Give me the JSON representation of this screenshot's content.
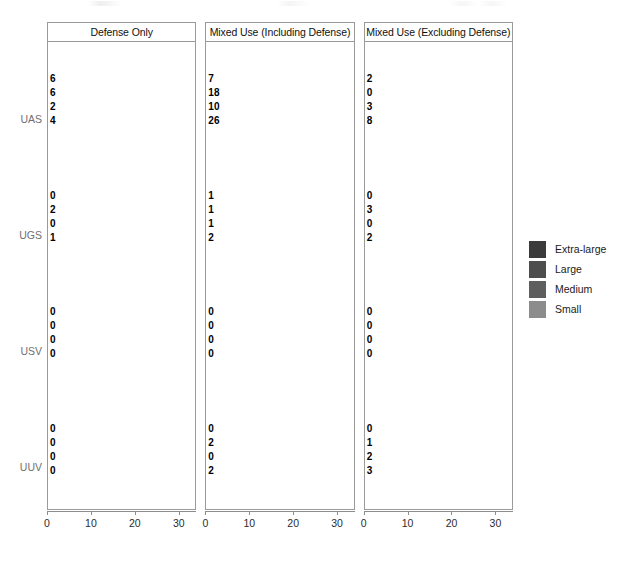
{
  "chart_data": {
    "type": "bar",
    "orientation": "horizontal",
    "title": "",
    "subtitle": "",
    "xlabel": "",
    "ylabel": "",
    "xlim": [
      0,
      34
    ],
    "xticks": [
      0,
      10,
      20,
      30
    ],
    "xticklabels": [
      "0",
      "10",
      "20",
      "30"
    ],
    "grid": false,
    "categories": [
      "UAS",
      "UGS",
      "USV",
      "UUV"
    ],
    "legend": {
      "position": "right",
      "entries": [
        {
          "name": "Extra-large",
          "color": "#3b3b3b"
        },
        {
          "name": "Large",
          "color": "#4d4d4d"
        },
        {
          "name": "Medium",
          "color": "#5e5e5e"
        },
        {
          "name": "Small",
          "color": "#8c8c8c"
        }
      ]
    },
    "panels": [
      {
        "label": "Defense Only",
        "series": [
          {
            "name": "Extra-large",
            "values": [
              6,
              0,
              0,
              0
            ]
          },
          {
            "name": "Large",
            "values": [
              6,
              2,
              0,
              0
            ]
          },
          {
            "name": "Medium",
            "values": [
              2,
              0,
              0,
              0
            ]
          },
          {
            "name": "Small",
            "values": [
              4,
              1,
              0,
              0
            ]
          }
        ]
      },
      {
        "label": "Mixed Use (Including Defense)",
        "series": [
          {
            "name": "Extra-large",
            "values": [
              7,
              1,
              0,
              0
            ]
          },
          {
            "name": "Large",
            "values": [
              18,
              1,
              0,
              2
            ]
          },
          {
            "name": "Medium",
            "values": [
              10,
              1,
              0,
              0
            ]
          },
          {
            "name": "Small",
            "values": [
              26,
              2,
              0,
              2
            ]
          }
        ]
      },
      {
        "label": "Mixed Use (Excluding Defense)",
        "series": [
          {
            "name": "Extra-large",
            "values": [
              2,
              0,
              0,
              0
            ]
          },
          {
            "name": "Large",
            "values": [
              0,
              3,
              0,
              1
            ]
          },
          {
            "name": "Medium",
            "values": [
              3,
              0,
              0,
              2
            ]
          },
          {
            "name": "Small",
            "values": [
              8,
              2,
              0,
              3
            ]
          }
        ]
      }
    ]
  }
}
